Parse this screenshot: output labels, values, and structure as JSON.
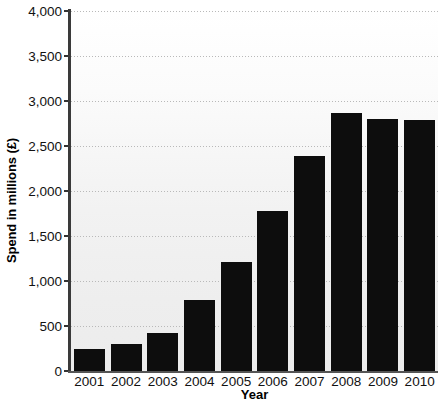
{
  "chart_data": {
    "type": "bar",
    "title": "",
    "xlabel": "Year",
    "ylabel": "Spend in millions (£)",
    "categories": [
      "2001",
      "2002",
      "2003",
      "2004",
      "2005",
      "2006",
      "2007",
      "2008",
      "2009",
      "2010"
    ],
    "values": [
      250,
      300,
      420,
      790,
      1210,
      1780,
      2390,
      2870,
      2800,
      2790
    ],
    "ylim": [
      0,
      4000
    ],
    "ytick_values": [
      0,
      500,
      1000,
      1500,
      2000,
      2500,
      3000,
      3500,
      4000
    ],
    "ytick_labels": [
      "0",
      "500",
      "1,000",
      "1,500",
      "2,000",
      "2,500",
      "3,000",
      "3,500",
      "4,000"
    ],
    "grid": true,
    "legend": "none",
    "series": [
      {
        "name": "Spend",
        "color": "#0d0d0d",
        "values": [
          250,
          300,
          420,
          790,
          1210,
          1780,
          2390,
          2870,
          2800,
          2790
        ]
      }
    ],
    "colors": {
      "bar": "#0d0d0d",
      "gridline": "#b9b9b9",
      "axis": "#3a3a3a",
      "plot_background_top": "#ffffff",
      "plot_background_bottom": "#ececec",
      "text": "#111111"
    }
  }
}
